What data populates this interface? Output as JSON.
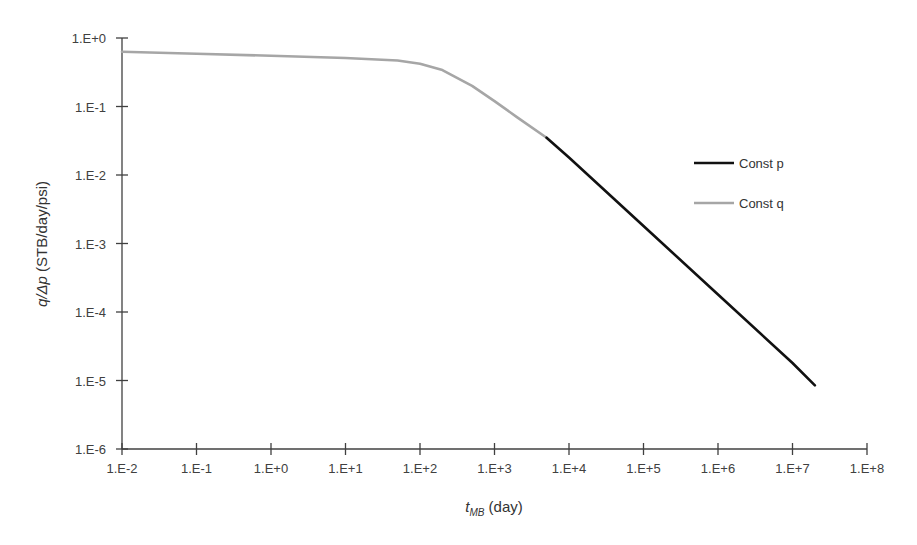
{
  "chart_data": {
    "type": "line",
    "title": "",
    "xlabel": "t_MB (day)",
    "xlabel_main": "t",
    "xlabel_sub": "MB",
    "xlabel_unit": " (day)",
    "ylabel": "q/Δp (STB/day/psi)",
    "ylabel_italic": "q/Δp",
    "ylabel_unit": " (STB/day/psi)",
    "xscale": "log",
    "yscale": "log",
    "xlim": [
      0.01,
      100000000
    ],
    "ylim": [
      1e-06,
      1
    ],
    "x_ticks": [
      "1.E-2",
      "1.E-1",
      "1.E+0",
      "1.E+1",
      "1.E+2",
      "1.E+3",
      "1.E+4",
      "1.E+5",
      "1.E+6",
      "1.E+7",
      "1.E+8"
    ],
    "y_ticks": [
      "1.E+0",
      "1.E-1",
      "1.E-2",
      "1.E-3",
      "1.E-4",
      "1.E-5",
      "1.E-6"
    ],
    "grid": false,
    "legend_position": "right",
    "series": [
      {
        "name": "Const p",
        "color": "#111111",
        "x": [
          5000,
          10000,
          100000,
          1000000,
          10000000,
          20000000
        ],
        "y": [
          0.035,
          0.018,
          0.0018,
          0.00018,
          1.8e-05,
          8.5e-06
        ]
      },
      {
        "name": "Const q",
        "color": "#a6a6a6",
        "x": [
          0.01,
          0.1,
          1,
          10,
          50,
          100,
          200,
          500,
          1000,
          2000,
          5000
        ],
        "y": [
          0.63,
          0.59,
          0.55,
          0.51,
          0.47,
          0.42,
          0.34,
          0.2,
          0.12,
          0.07,
          0.035
        ]
      }
    ]
  }
}
